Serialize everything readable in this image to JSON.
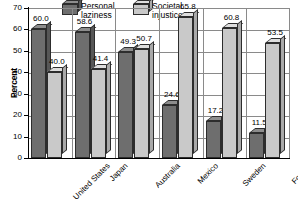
{
  "chart_data": {
    "type": "bar",
    "title": "",
    "subtitle": "",
    "xlabel": "",
    "ylabel": "Percent",
    "ylim": [
      0,
      70
    ],
    "ytick_step": 10,
    "yticks": [
      "70",
      "60",
      "50",
      "40",
      "30",
      "20",
      "10",
      "0"
    ],
    "grid": true,
    "grid_orientation": "horizontal-and-category-separators",
    "legend_position": "top-center",
    "style": "3d-bar",
    "categories": [
      "United States",
      "Japan",
      "Australia",
      "Mexico",
      "Sweden",
      "Former West\nGermany"
    ],
    "series": [
      {
        "name": "Personal laziness",
        "color": "#6e6e6e",
        "values": [
          60.0,
          58.6,
          49.3,
          24.6,
          17.2,
          11.5
        ],
        "labels": [
          "60.0",
          "58.6",
          "49.3",
          "24.6",
          "17.2",
          "11.5"
        ]
      },
      {
        "name": "Societal injustice",
        "color": "#c9c9c9",
        "values": [
          40.0,
          41.4,
          50.7,
          65.8,
          60.8,
          53.5
        ],
        "labels": [
          "40.0",
          "41.4",
          "50.7",
          "65.8",
          "60.8",
          "53.5"
        ]
      }
    ]
  },
  "legend": {
    "items": [
      {
        "label": "Personal laziness",
        "swatch": "dark"
      },
      {
        "label": "Societal injustice",
        "swatch": "light"
      }
    ]
  }
}
